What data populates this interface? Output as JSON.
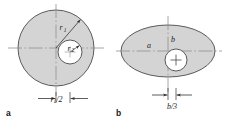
{
  "figure": {
    "background_color": "#ffffff",
    "fill_color": "#d4d4d4",
    "stroke_color": "#5a5a5a",
    "axis_color": "#8a8a8a",
    "text_color": "#1a1a1a",
    "panels": [
      {
        "id": "a",
        "letter": "a",
        "shape": "circle-with-offset-hole",
        "outer_label": "r",
        "outer_label_sub": "1",
        "inner_label": "r",
        "inner_label_sub": "2",
        "dimension_label": "r",
        "dimension_label_sub": "1",
        "dimension_label_suffix": "/2",
        "dimension_text": "r₁/2"
      },
      {
        "id": "b",
        "letter": "b",
        "shape": "ellipse-with-offset-hole",
        "semi_major_label": "a",
        "semi_minor_label": "b",
        "dimension_label": "b",
        "dimension_label_suffix": "/3",
        "dimension_text": "b/3"
      }
    ]
  }
}
